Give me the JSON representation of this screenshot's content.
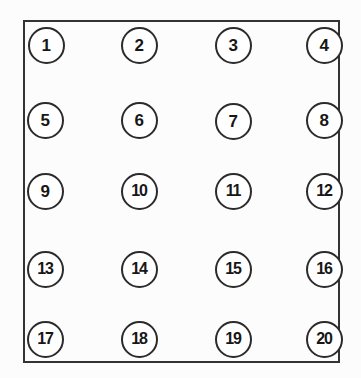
{
  "diagram": {
    "type": "node-grid",
    "rows": 5,
    "columns": 4,
    "node_count": 20,
    "frame": {
      "shape": "rectangle",
      "stroke_color": "#333333",
      "fill_color": "#ffffff",
      "x": 23,
      "y": 20,
      "width": 317,
      "height": 343
    },
    "node_style": {
      "shape": "circle",
      "diameter": 37,
      "stroke_color": "#2b2b2b",
      "fill_color": "#ffffff",
      "text_color": "#171717"
    },
    "nodes": [
      {
        "label": "1",
        "row": 1,
        "col": 1,
        "cx": 46,
        "cy": 45
      },
      {
        "label": "2",
        "row": 1,
        "col": 2,
        "cx": 139,
        "cy": 45
      },
      {
        "label": "3",
        "row": 1,
        "col": 3,
        "cx": 233,
        "cy": 45
      },
      {
        "label": "4",
        "row": 1,
        "col": 4,
        "cx": 324,
        "cy": 45
      },
      {
        "label": "5",
        "row": 2,
        "col": 1,
        "cx": 45,
        "cy": 120
      },
      {
        "label": "6",
        "row": 2,
        "col": 2,
        "cx": 139,
        "cy": 120
      },
      {
        "label": "7",
        "row": 2,
        "col": 3,
        "cx": 233,
        "cy": 121
      },
      {
        "label": "8",
        "row": 2,
        "col": 4,
        "cx": 324,
        "cy": 120
      },
      {
        "label": "9",
        "row": 3,
        "col": 1,
        "cx": 45,
        "cy": 191
      },
      {
        "label": "10",
        "row": 3,
        "col": 2,
        "cx": 139,
        "cy": 191
      },
      {
        "label": "11",
        "row": 3,
        "col": 3,
        "cx": 233,
        "cy": 191
      },
      {
        "label": "12",
        "row": 3,
        "col": 4,
        "cx": 324,
        "cy": 191
      },
      {
        "label": "13",
        "row": 4,
        "col": 1,
        "cx": 45,
        "cy": 269
      },
      {
        "label": "14",
        "row": 4,
        "col": 2,
        "cx": 139,
        "cy": 269
      },
      {
        "label": "15",
        "row": 4,
        "col": 3,
        "cx": 233,
        "cy": 269
      },
      {
        "label": "16",
        "row": 4,
        "col": 4,
        "cx": 324,
        "cy": 269
      },
      {
        "label": "17",
        "row": 5,
        "col": 1,
        "cx": 45,
        "cy": 339
      },
      {
        "label": "18",
        "row": 5,
        "col": 2,
        "cx": 139,
        "cy": 339
      },
      {
        "label": "19",
        "row": 5,
        "col": 3,
        "cx": 233,
        "cy": 339
      },
      {
        "label": "20",
        "row": 5,
        "col": 4,
        "cx": 324,
        "cy": 339
      }
    ]
  }
}
